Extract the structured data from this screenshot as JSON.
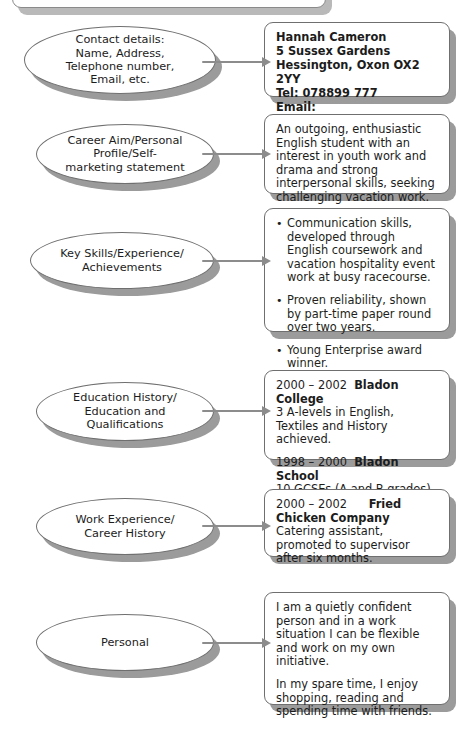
{
  "document": {
    "title": "CV structure diagram",
    "colors": {
      "outline": "#6f6f6f",
      "shadow": "#9b9b9b",
      "arrow": "#8c8c8c",
      "text": "#1c1c1c",
      "background": "#ffffff"
    }
  },
  "sections": [
    {
      "id": "contact",
      "label": "Contact details:\nName, Address,\nTelephone number,\nEmail, etc.",
      "content": {
        "type": "lines-bold",
        "lines": [
          "Hannah Cameron",
          "5 Sussex Gardens",
          "Hessington, Oxon OX2 2YY",
          "Tel: 078899 777",
          "Email: Hannah@email.org.uk"
        ]
      }
    },
    {
      "id": "career-aim",
      "label": "Career Aim/Personal\nProfile/Self-\nmarketing statement",
      "content": {
        "type": "paragraphs",
        "paragraphs": [
          "An outgoing, enthusiastic English student with an interest in youth work and drama and strong interpersonal skills, seeking challenging vacation work."
        ]
      }
    },
    {
      "id": "key-skills",
      "label": "Key Skills/Experience/\nAchievements",
      "content": {
        "type": "bullets",
        "bullets": [
          "Communication skills, developed through English coursework and vacation hospitality event work at busy racecourse.",
          "Proven reliability, shown by part-time paper round over two years.",
          "Young Enterprise award winner."
        ]
      }
    },
    {
      "id": "education",
      "label": "Education History/\nEducation and\nQualifications",
      "content": {
        "type": "entries",
        "entries": [
          {
            "dates": "2000 – 2002",
            "organisation": "Bladon College",
            "detail": "3 A-levels in English, Textiles and History achieved."
          },
          {
            "dates": "1998 – 2000",
            "organisation": "Bladon School",
            "detail": "10 GCSEs (A and B grades) achieved."
          }
        ]
      }
    },
    {
      "id": "work-experience",
      "label": "Work Experience/\nCareer History",
      "content": {
        "type": "entries",
        "entries": [
          {
            "dates": "2000 – 2002",
            "organisation": "Fried Chicken Company",
            "detail": "Catering assistant, promoted to supervisor after six months."
          }
        ]
      }
    },
    {
      "id": "personal",
      "label": "Personal",
      "content": {
        "type": "paragraphs",
        "paragraphs": [
          "I am a quietly confident person and in a work situation I can be flexible and work on my own initiative.",
          "In my spare time, I enjoy shopping, reading and spending time with friends."
        ]
      }
    }
  ]
}
